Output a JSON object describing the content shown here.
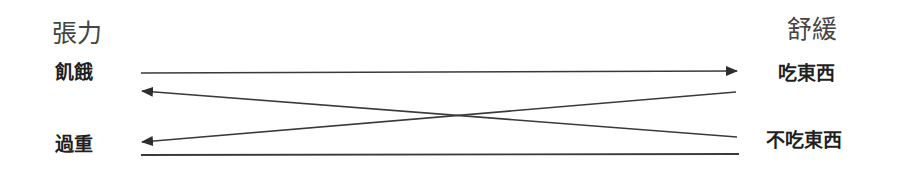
{
  "diagram": {
    "left_header": "張力",
    "right_header": "舒緩",
    "left_items": [
      "飢餓",
      "過重"
    ],
    "right_items": [
      "吃東西",
      "不吃東西"
    ],
    "connections": [
      {
        "from": "飢餓",
        "to": "吃東西",
        "direction": "left-to-right"
      },
      {
        "from": "吃東西",
        "to": "過重",
        "direction": "right-to-left"
      },
      {
        "from": "不吃東西",
        "to": "飢餓",
        "direction": "right-to-left"
      },
      {
        "from": "過重",
        "to": "不吃東西",
        "direction": "left-to-right"
      }
    ],
    "line_color": "#3a3a3a"
  }
}
